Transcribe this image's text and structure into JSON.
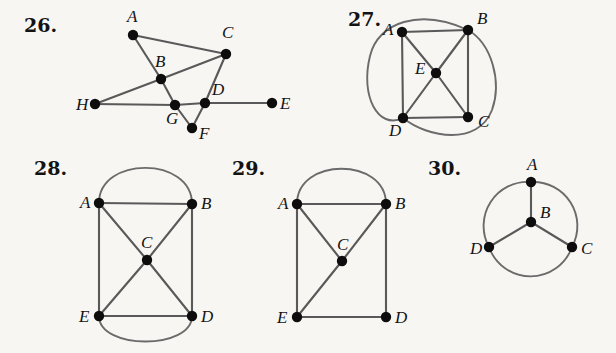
{
  "page": {
    "background_color": "#f7f6f3",
    "ink_color": "#131313",
    "edge_color": "#595959",
    "arc_color": "#6b6b6b",
    "vertex_color": "#0d0d0d",
    "width": 616,
    "height": 353
  },
  "figures": [
    {
      "id": "figure-26",
      "number_label": "26.",
      "number_pos": {
        "x": 24,
        "y": 32
      },
      "vertices": [
        {
          "id": "A",
          "label": "A",
          "x": 133,
          "y": 35,
          "label_x": 127,
          "label_y": 22
        },
        {
          "id": "B",
          "label": "B",
          "x": 161,
          "y": 79,
          "label_x": 155,
          "label_y": 67
        },
        {
          "id": "C",
          "label": "C",
          "x": 226,
          "y": 54,
          "label_x": 222,
          "label_y": 38
        },
        {
          "id": "D",
          "label": "D",
          "x": 205,
          "y": 103,
          "label_x": 212,
          "label_y": 95
        },
        {
          "id": "E",
          "label": "E",
          "x": 272,
          "y": 103,
          "label_x": 280,
          "label_y": 109
        },
        {
          "id": "F",
          "label": "F",
          "x": 192,
          "y": 128,
          "label_x": 199,
          "label_y": 139
        },
        {
          "id": "G",
          "label": "G",
          "x": 175,
          "y": 105,
          "label_x": 166,
          "label_y": 124
        },
        {
          "id": "H",
          "label": "H",
          "x": 95,
          "y": 104,
          "label_x": 76,
          "label_y": 110
        }
      ],
      "edges": [
        {
          "from": "A",
          "to": "C"
        },
        {
          "from": "A",
          "to": "B"
        },
        {
          "from": "H",
          "to": "B"
        },
        {
          "from": "B",
          "to": "C"
        },
        {
          "from": "B",
          "to": "G"
        },
        {
          "from": "C",
          "to": "D"
        },
        {
          "from": "H",
          "to": "G"
        },
        {
          "from": "G",
          "to": "D"
        },
        {
          "from": "D",
          "to": "E"
        },
        {
          "from": "G",
          "to": "F"
        },
        {
          "from": "F",
          "to": "D"
        }
      ],
      "arcs": []
    },
    {
      "id": "figure-27",
      "number_label": "27.",
      "number_pos": {
        "x": 348,
        "y": 26
      },
      "vertices": [
        {
          "id": "A",
          "label": "A",
          "x": 402,
          "y": 32,
          "label_x": 383,
          "label_y": 35
        },
        {
          "id": "B",
          "label": "B",
          "x": 468,
          "y": 30,
          "label_x": 477,
          "label_y": 24
        },
        {
          "id": "C",
          "label": "C",
          "x": 468,
          "y": 117,
          "label_x": 478,
          "label_y": 127
        },
        {
          "id": "D",
          "label": "D",
          "x": 403,
          "y": 118,
          "label_x": 389,
          "label_y": 136
        },
        {
          "id": "E",
          "label": "E",
          "x": 436,
          "y": 73,
          "label_x": 415,
          "label_y": 74
        }
      ],
      "edges": [
        {
          "from": "A",
          "to": "B"
        },
        {
          "from": "A",
          "to": "D"
        },
        {
          "from": "B",
          "to": "C"
        },
        {
          "from": "D",
          "to": "C"
        },
        {
          "from": "A",
          "to": "E"
        },
        {
          "from": "B",
          "to": "E"
        },
        {
          "from": "C",
          "to": "E"
        },
        {
          "from": "D",
          "to": "E"
        }
      ],
      "arcs": [
        {
          "from": "B",
          "to": "D",
          "path": "M 468 30 C 420 8 378 22 370 56 C 360 96 378 130 403 118",
          "note": "ellipse-left-side"
        },
        {
          "from": "B",
          "to": "D",
          "path": "M 468 30 C 492 44 502 82 492 110 C 478 146 428 138 403 118",
          "note": "ellipse-right-side"
        }
      ]
    },
    {
      "id": "figure-28",
      "number_label": "28.",
      "number_pos": {
        "x": 34,
        "y": 175
      },
      "vertices": [
        {
          "id": "A",
          "label": "A",
          "x": 99,
          "y": 203,
          "label_x": 80,
          "label_y": 208
        },
        {
          "id": "B",
          "label": "B",
          "x": 192,
          "y": 204,
          "label_x": 201,
          "label_y": 209
        },
        {
          "id": "C",
          "label": "C",
          "x": 147,
          "y": 260,
          "label_x": 141,
          "label_y": 248
        },
        {
          "id": "D",
          "label": "D",
          "x": 192,
          "y": 316,
          "label_x": 201,
          "label_y": 322
        },
        {
          "id": "E",
          "label": "E",
          "x": 99,
          "y": 316,
          "label_x": 79,
          "label_y": 322
        }
      ],
      "edges": [
        {
          "from": "A",
          "to": "B"
        },
        {
          "from": "A",
          "to": "E"
        },
        {
          "from": "B",
          "to": "D"
        },
        {
          "from": "E",
          "to": "D"
        },
        {
          "from": "A",
          "to": "C"
        },
        {
          "from": "B",
          "to": "C"
        },
        {
          "from": "C",
          "to": "E"
        },
        {
          "from": "C",
          "to": "D"
        }
      ],
      "arcs": [
        {
          "from": "A",
          "to": "B",
          "path": "M 99 203 C 99 156 192 156 192 204",
          "note": "top-arc"
        },
        {
          "from": "E",
          "to": "D",
          "path": "M 99 316 C 99 350 192 350 192 316",
          "note": "bottom-arc"
        }
      ]
    },
    {
      "id": "figure-29",
      "number_label": "29.",
      "number_pos": {
        "x": 232,
        "y": 175
      },
      "vertices": [
        {
          "id": "A",
          "label": "A",
          "x": 297,
          "y": 204,
          "label_x": 278,
          "label_y": 209
        },
        {
          "id": "B",
          "label": "B",
          "x": 386,
          "y": 204,
          "label_x": 395,
          "label_y": 209
        },
        {
          "id": "C",
          "label": "C",
          "x": 342,
          "y": 261,
          "label_x": 337,
          "label_y": 250
        },
        {
          "id": "D",
          "label": "D",
          "x": 386,
          "y": 317,
          "label_x": 395,
          "label_y": 323
        },
        {
          "id": "E",
          "label": "E",
          "x": 297,
          "y": 317,
          "label_x": 277,
          "label_y": 323
        }
      ],
      "edges": [
        {
          "from": "A",
          "to": "B"
        },
        {
          "from": "A",
          "to": "E"
        },
        {
          "from": "B",
          "to": "D"
        },
        {
          "from": "E",
          "to": "D"
        },
        {
          "from": "A",
          "to": "C"
        },
        {
          "from": "B",
          "to": "C"
        },
        {
          "from": "C",
          "to": "E"
        }
      ],
      "arcs": [
        {
          "from": "A",
          "to": "B",
          "path": "M 297 204 C 297 157 386 157 386 204",
          "note": "top-arc"
        }
      ]
    },
    {
      "id": "figure-30",
      "number_label": "30.",
      "number_pos": {
        "x": 428,
        "y": 175
      },
      "vertices": [
        {
          "id": "A",
          "label": "A",
          "x": 531,
          "y": 182,
          "label_x": 527,
          "label_y": 170
        },
        {
          "id": "B",
          "label": "B",
          "x": 531,
          "y": 222,
          "label_x": 540,
          "label_y": 218
        },
        {
          "id": "C",
          "label": "C",
          "x": 572,
          "y": 247,
          "label_x": 581,
          "label_y": 254
        },
        {
          "id": "D",
          "label": "D",
          "x": 489,
          "y": 247,
          "label_x": 470,
          "label_y": 254
        }
      ],
      "edges": [
        {
          "from": "A",
          "to": "B"
        },
        {
          "from": "B",
          "to": "C"
        },
        {
          "from": "B",
          "to": "D"
        }
      ],
      "arcs": [
        {
          "from": "A",
          "to": "C",
          "path": "M 531 182 A 44 44 0 0 1 572 247",
          "note": "circle-upper-right"
        },
        {
          "from": "C",
          "to": "D",
          "path": "M 572 247 A 44 44 0 0 1 489 247",
          "note": "circle-bottom"
        },
        {
          "from": "D",
          "to": "A",
          "path": "M 489 247 A 44 44 0 0 1 531 182",
          "note": "circle-upper-left"
        }
      ]
    }
  ]
}
